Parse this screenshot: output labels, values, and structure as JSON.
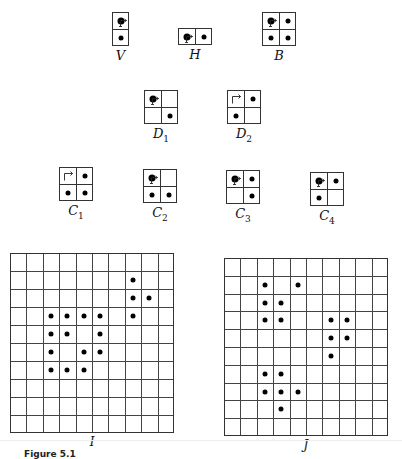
{
  "patterns": [
    {
      "id": "V",
      "label": "V",
      "sub": "",
      "x": 112,
      "y": 12,
      "cols": 1,
      "rows": 2,
      "cell": 17,
      "dots": [
        [
          0,
          0,
          "big"
        ],
        [
          1,
          0,
          ""
        ]
      ],
      "arrow": "down-left-tick"
    },
    {
      "id": "H",
      "label": "H",
      "sub": "",
      "x": 178,
      "y": 28,
      "cols": 2,
      "rows": 1,
      "cell": 17,
      "dots": [
        [
          0,
          0,
          "big"
        ],
        [
          0,
          1,
          ""
        ]
      ],
      "arrow": "right-down-tick"
    },
    {
      "id": "B",
      "label": "B",
      "sub": "",
      "x": 262,
      "y": 12,
      "cols": 2,
      "rows": 2,
      "cell": 17,
      "dots": [
        [
          0,
          0,
          "big"
        ],
        [
          0,
          1,
          ""
        ],
        [
          1,
          0,
          ""
        ],
        [
          1,
          1,
          ""
        ]
      ],
      "arrow": "right-down-tick"
    },
    {
      "id": "D1",
      "label": "D",
      "sub": "1",
      "x": 144,
      "y": 90,
      "cols": 2,
      "rows": 2,
      "cell": 17,
      "dots": [
        [
          0,
          0,
          "big"
        ],
        [
          1,
          1,
          ""
        ]
      ],
      "arrow": "right-down-tick"
    },
    {
      "id": "D2",
      "label": "D",
      "sub": "2",
      "x": 227,
      "y": 90,
      "cols": 2,
      "rows": 2,
      "cell": 17,
      "dots": [
        [
          0,
          1,
          ""
        ],
        [
          1,
          0,
          ""
        ]
      ],
      "arrow": "corner"
    },
    {
      "id": "C1",
      "label": "C",
      "sub": "1",
      "x": 59,
      "y": 167,
      "cols": 2,
      "rows": 2,
      "cell": 17,
      "dots": [
        [
          0,
          1,
          ""
        ],
        [
          1,
          0,
          ""
        ],
        [
          1,
          1,
          ""
        ]
      ],
      "arrow": "corner"
    },
    {
      "id": "C2",
      "label": "C",
      "sub": "2",
      "x": 143,
      "y": 169,
      "cols": 2,
      "rows": 2,
      "cell": 17,
      "dots": [
        [
          0,
          0,
          "big"
        ],
        [
          1,
          0,
          ""
        ],
        [
          1,
          1,
          ""
        ]
      ],
      "arrow": "right-down-tick"
    },
    {
      "id": "C3",
      "label": "C",
      "sub": "3",
      "x": 226,
      "y": 170,
      "cols": 2,
      "rows": 2,
      "cell": 17,
      "dots": [
        [
          0,
          0,
          "big"
        ],
        [
          0,
          1,
          ""
        ],
        [
          1,
          1,
          ""
        ]
      ],
      "arrow": "right-down-tick"
    },
    {
      "id": "C4",
      "label": "C",
      "sub": "4",
      "x": 310,
      "y": 172,
      "cols": 2,
      "rows": 2,
      "cell": 17,
      "dots": [
        [
          0,
          0,
          "big"
        ],
        [
          0,
          1,
          ""
        ],
        [
          1,
          0,
          ""
        ]
      ],
      "arrow": "right-down-tick"
    }
  ],
  "grids": [
    {
      "id": "I",
      "label": "I",
      "x": 10,
      "y": 253,
      "size": 10,
      "width": 164,
      "height": 180,
      "dots": [
        [
          1,
          7
        ],
        [
          2,
          7
        ],
        [
          2,
          8
        ],
        [
          3,
          2
        ],
        [
          3,
          3
        ],
        [
          3,
          4
        ],
        [
          3,
          5
        ],
        [
          3,
          7
        ],
        [
          4,
          2
        ],
        [
          4,
          3
        ],
        [
          4,
          5
        ],
        [
          5,
          2
        ],
        [
          5,
          4
        ],
        [
          5,
          5
        ],
        [
          6,
          2
        ],
        [
          6,
          3
        ],
        [
          6,
          4
        ]
      ]
    },
    {
      "id": "J",
      "label": "J",
      "x": 224,
      "y": 258,
      "size": 10,
      "width": 164,
      "height": 178,
      "dots": [
        [
          1,
          2
        ],
        [
          1,
          4
        ],
        [
          2,
          2
        ],
        [
          2,
          3
        ],
        [
          3,
          2
        ],
        [
          3,
          3
        ],
        [
          3,
          6
        ],
        [
          3,
          7
        ],
        [
          4,
          6
        ],
        [
          4,
          7
        ],
        [
          5,
          6
        ],
        [
          6,
          2
        ],
        [
          6,
          3
        ],
        [
          7,
          2
        ],
        [
          7,
          3
        ],
        [
          7,
          4
        ],
        [
          8,
          3
        ]
      ]
    }
  ],
  "caption": "Figure 5.1"
}
